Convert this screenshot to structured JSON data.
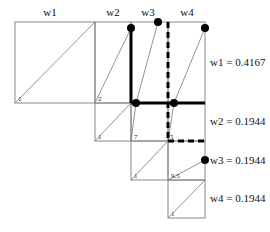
{
  "column_labels": [
    "w1",
    "w2",
    "w3",
    "w4"
  ],
  "row_labels": [
    "w1 = 0.4167",
    "w2 = 0.1944",
    "w3 = 0.1944",
    "w4 = 0.1944"
  ],
  "cell_labels": {
    "r1c1": "1",
    "r1c2": "2",
    "r2c2": "1",
    "r2c3": "7",
    "r2c3b": "5",
    "r3c3": "1",
    "r3c4": "9.5",
    "r4c4": "1",
    "r1c3": "3",
    "r1c4": "3",
    "r2c4": "1"
  },
  "weights": {
    "w1": 0.4167,
    "w2": 0.1944,
    "w3": 0.1944,
    "w4": 0.1944
  },
  "colors": {
    "grid": "#888888",
    "path": "#000000"
  }
}
